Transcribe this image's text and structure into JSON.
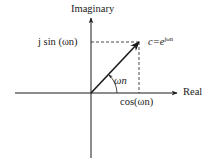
{
  "diagram": {
    "axes": {
      "horizontal_label": "Real",
      "vertical_label": "Imaginary"
    },
    "labels": {
      "imag_projection": "j sin (ωn)",
      "real_projection": "cos(ωn)",
      "point_c_prefix": "c=e",
      "point_c_exponent": "jωn",
      "angle": "ωn"
    },
    "colors": {
      "ink": "#1a1a1a",
      "background": "#ffffff"
    }
  }
}
